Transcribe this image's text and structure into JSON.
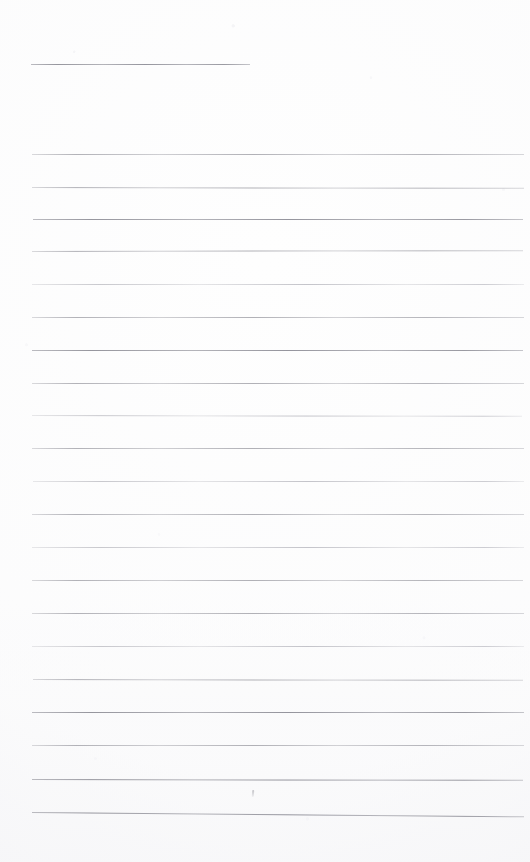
{
  "document": {
    "kind": "scanned-ruled-page",
    "description": "Blank lined writing page scan",
    "page_number_visible": "",
    "background_color": "#fefefe",
    "rule_color": "#b9b9bd",
    "rule_color_dark": "#84848d",
    "width_px": 530,
    "height_px": 862
  },
  "title_rule": {
    "name": "heading-underline",
    "x": 31,
    "y": 64,
    "width": 219,
    "thickness": 1,
    "tone": "darker"
  },
  "body_rules": {
    "left_x": 32,
    "right_x": 524,
    "width": 492,
    "count": 21,
    "spacing": 32.9,
    "lines": [
      {
        "y": 154,
        "tone": "soft",
        "slant": 0.0,
        "left": 32,
        "width": 492
      },
      {
        "y": 187,
        "tone": "soft",
        "slant": 0.1,
        "left": 32,
        "width": 492
      },
      {
        "y": 219,
        "tone": "darker",
        "slant": 0.0,
        "left": 33,
        "width": 490
      },
      {
        "y": 251,
        "tone": "soft",
        "slant": -0.1,
        "left": 32,
        "width": 491
      },
      {
        "y": 284,
        "tone": "faint",
        "slant": 0.0,
        "left": 32,
        "width": 492
      },
      {
        "y": 317,
        "tone": "soft",
        "slant": 0.0,
        "left": 32,
        "width": 492
      },
      {
        "y": 350,
        "tone": "darker",
        "slant": 0.0,
        "left": 32,
        "width": 491
      },
      {
        "y": 383,
        "tone": "soft",
        "slant": 0.0,
        "left": 32,
        "width": 492
      },
      {
        "y": 415,
        "tone": "faint",
        "slant": 0.1,
        "left": 32,
        "width": 490
      },
      {
        "y": 448,
        "tone": "soft",
        "slant": 0.0,
        "left": 32,
        "width": 492
      },
      {
        "y": 481,
        "tone": "faint",
        "slant": 0.0,
        "left": 33,
        "width": 491
      },
      {
        "y": 514,
        "tone": "soft",
        "slant": 0.0,
        "left": 32,
        "width": 492
      },
      {
        "y": 547,
        "tone": "faint",
        "slant": 0.0,
        "left": 32,
        "width": 492
      },
      {
        "y": 580,
        "tone": "soft",
        "slant": 0.0,
        "left": 32,
        "width": 491
      },
      {
        "y": 613,
        "tone": "soft",
        "slant": 0.0,
        "left": 32,
        "width": 492
      },
      {
        "y": 646,
        "tone": "faint",
        "slant": 0.0,
        "left": 32,
        "width": 492
      },
      {
        "y": 679,
        "tone": "soft",
        "slant": 0.1,
        "left": 33,
        "width": 490
      },
      {
        "y": 712,
        "tone": "darker",
        "slant": 0.0,
        "left": 32,
        "width": 492
      },
      {
        "y": 745,
        "tone": "soft",
        "slant": 0.0,
        "left": 32,
        "width": 492
      },
      {
        "y": 779,
        "tone": "darker",
        "slant": 0.1,
        "left": 32,
        "width": 491
      },
      {
        "y": 812,
        "tone": "darker",
        "slant": 0.5,
        "left": 32,
        "width": 492
      }
    ]
  },
  "stray_marks": [
    {
      "name": "pen-dot",
      "x": 252,
      "y": 790
    }
  ]
}
